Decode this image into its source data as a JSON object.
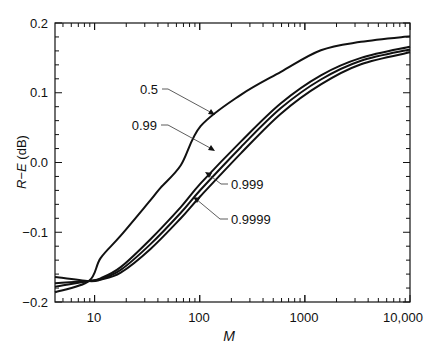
{
  "chart_data": {
    "type": "line",
    "title": "",
    "xlabel": "M",
    "ylabel": "R−E (dB)",
    "xscale": "log",
    "xlim": [
      4.2,
      10000
    ],
    "ylim": [
      -0.2,
      0.2
    ],
    "x_ticks": [
      10,
      100,
      1000,
      10000
    ],
    "x_tick_labels": [
      "10",
      "100",
      "1000",
      "10,000"
    ],
    "y_ticks": [
      -0.2,
      -0.1,
      0.0,
      0.1,
      0.2
    ],
    "y_tick_labels": [
      "−0.2",
      "−0.1",
      "0.0",
      "0.1",
      "0.2"
    ],
    "grid": false,
    "legend": "none (curves labeled with callout arrows)",
    "series": [
      {
        "name": "0.5",
        "x": [
          4.2,
          8.8,
          11.4,
          17.7,
          34,
          42.5,
          66,
          102,
          246,
          591,
          1420,
          3420,
          10000
        ],
        "y": [
          -0.186,
          -0.17,
          -0.137,
          -0.105,
          -0.054,
          -0.036,
          -0.004,
          0.052,
          0.097,
          0.13,
          0.161,
          0.173,
          0.181
        ]
      },
      {
        "name": "0.99",
        "x": [
          4.2,
          8.8,
          11.4,
          17.7,
          34,
          66,
          102,
          246,
          591,
          1420,
          3420,
          10000
        ],
        "y": [
          -0.178,
          -0.17,
          -0.166,
          -0.15,
          -0.11,
          -0.064,
          -0.03,
          0.03,
          0.085,
          0.125,
          0.15,
          0.166
        ]
      },
      {
        "name": "0.999",
        "x": [
          4.2,
          8.8,
          11.4,
          17.7,
          34,
          66,
          102,
          246,
          591,
          1420,
          3420,
          10000
        ],
        "y": [
          -0.173,
          -0.17,
          -0.167,
          -0.154,
          -0.117,
          -0.072,
          -0.039,
          0.022,
          0.078,
          0.119,
          0.146,
          0.162
        ]
      },
      {
        "name": "0.9999",
        "x": [
          4.2,
          8.8,
          11.4,
          17.7,
          34,
          66,
          102,
          246,
          591,
          1420,
          3420,
          10000
        ],
        "y": [
          -0.164,
          -0.17,
          -0.168,
          -0.158,
          -0.124,
          -0.08,
          -0.048,
          0.013,
          0.07,
          0.112,
          0.141,
          0.158
        ]
      }
    ],
    "annotations": [
      {
        "text": "0.5",
        "target_series": "0.5"
      },
      {
        "text": "0.99",
        "target_series": "0.99"
      },
      {
        "text": "0.999",
        "target_series": "0.999"
      },
      {
        "text": "0.9999",
        "target_series": "0.9999"
      }
    ]
  },
  "labels": {
    "xlabel": "M",
    "ylabel_R": "R",
    "ylabel_dash": "−",
    "ylabel_E": "E",
    "ylabel_unit": " (dB)",
    "callout_0": "0.5",
    "callout_1": "0.99",
    "callout_2": "0.999",
    "callout_3": "0.9999",
    "xtick_0": "10",
    "xtick_1": "100",
    "xtick_2": "1000",
    "xtick_3": "10,000",
    "ytick_0": "0.2",
    "ytick_1": "0.1",
    "ytick_2": "0.0",
    "ytick_3": "−0.1",
    "ytick_4": "−0.2"
  }
}
